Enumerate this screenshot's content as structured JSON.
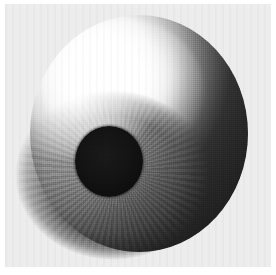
{
  "figure": {
    "medium": "grayscale halftone print",
    "canvas": {
      "width_px": 276,
      "height_px": 275,
      "background_color": "#ffffff"
    },
    "plate": {
      "label": "scanned image plate",
      "left_px": 5,
      "top_px": 4,
      "width_px": 266,
      "height_px": 263,
      "paper_color": "#ededed"
    },
    "parts": [
      {
        "name": "sclera-sphere",
        "label": "Sclera sphere",
        "shape": "circle",
        "center_x_px": 139,
        "center_y_px": 133,
        "width_px": 218,
        "height_px": 237,
        "highlight_color": "#ffffff",
        "midtone_color": "#c9c9c9",
        "shadow_color": "#4a4a4a"
      },
      {
        "name": "specular-highlight",
        "label": "Specular highlight",
        "shape": "ellipse",
        "center_x_px": 92,
        "center_y_px": 66,
        "color": "#ffffff",
        "position": "upper-left"
      },
      {
        "name": "iris",
        "label": "Iris",
        "shape": "ellipse",
        "center_x_px": 113,
        "center_y_px": 175,
        "width_px": 196,
        "height_px": 170,
        "base_color": "#8e8e8e",
        "edge_color": "#3f3f3f",
        "texture": "radial striations"
      },
      {
        "name": "pupil",
        "label": "Pupil",
        "shape": "circle",
        "center_x_px": 109,
        "center_y_px": 161,
        "width_px": 68,
        "height_px": 71,
        "color": "#111111"
      }
    ],
    "lighting": {
      "key_light_direction": "upper-left",
      "terminator_direction": "lower-right",
      "darkest_value": "#2b2b2b",
      "brightest_value": "#ffffff"
    },
    "texture_overlay": {
      "name": "halftone-dither",
      "label": "Halftone dither grid",
      "cell_px": 2
    }
  }
}
